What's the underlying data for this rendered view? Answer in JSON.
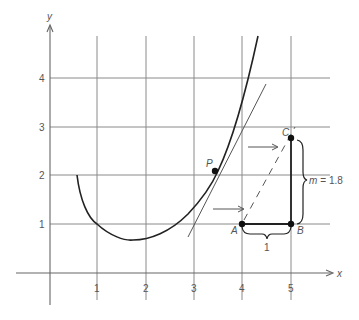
{
  "figure": {
    "type": "tangent-slope-diagram",
    "axes": {
      "x_label": "x",
      "y_label": "y",
      "x_ticks": [
        "1",
        "2",
        "3",
        "4",
        "5"
      ],
      "y_ticks": [
        "1",
        "2",
        "3",
        "4"
      ]
    },
    "points": {
      "P": {
        "label": "P",
        "x": 3.45,
        "y": 2.1
      },
      "A": {
        "label": "A",
        "x": 4,
        "y": 1
      },
      "B": {
        "label": "B",
        "x": 5,
        "y": 1
      },
      "C": {
        "label": "C",
        "x": 5,
        "y": 2.8
      }
    },
    "annotations": {
      "run_label": "1",
      "rise_label": "m = 1.8",
      "rise_var": "m",
      "rise_value": "= 1.8"
    },
    "colors": {
      "grid": "#8a8a8a",
      "curve": "#222222",
      "text": "#555555"
    }
  }
}
